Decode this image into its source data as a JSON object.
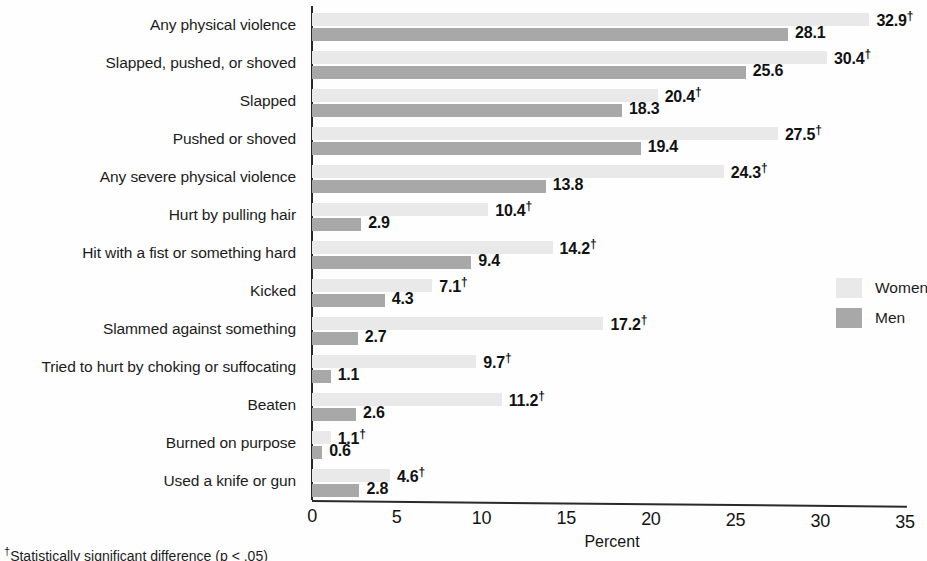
{
  "chart_data": {
    "type": "bar",
    "orientation": "horizontal",
    "title": "",
    "xlabel": "Percent",
    "ylabel": "",
    "xlim": [
      0,
      35
    ],
    "xticks": [
      0,
      5,
      10,
      15,
      20,
      25,
      30,
      35
    ],
    "grid": false,
    "legend_position": "right",
    "categories": [
      "Any physical violence",
      "Slapped, pushed, or shoved",
      "Slapped",
      "Pushed or shoved",
      "Any severe physical violence",
      "Hurt by pulling hair",
      "Hit with a fist or something hard",
      "Kicked",
      "Slammed against something",
      "Tried to hurt by choking or suffocating",
      "Beaten",
      "Burned on purpose",
      "Used a knife or gun"
    ],
    "series": [
      {
        "name": "Women",
        "color": "#e9e9e9",
        "values": [
          32.9,
          30.4,
          20.4,
          27.5,
          24.3,
          10.4,
          14.2,
          7.1,
          17.2,
          9.7,
          11.2,
          1.1,
          4.6
        ],
        "labels": [
          "32.9",
          "30.4",
          "20.4",
          "27.5",
          "24.3",
          "10.4",
          "14.2",
          "7.1",
          "17.2",
          "9.7",
          "11.2",
          "1.1",
          "4.6"
        ],
        "significant": [
          true,
          true,
          true,
          true,
          true,
          true,
          true,
          true,
          true,
          true,
          true,
          true,
          true
        ]
      },
      {
        "name": "Men",
        "color": "#a8a8a8",
        "values": [
          28.1,
          25.6,
          18.3,
          19.4,
          13.8,
          2.9,
          9.4,
          4.3,
          2.7,
          1.1,
          2.6,
          0.6,
          2.8
        ],
        "labels": [
          "28.1",
          "25.6",
          "18.3",
          "19.4",
          "13.8",
          "2.9",
          "9.4",
          "4.3",
          "2.7",
          "1.1",
          "2.6",
          "0.6",
          "2.8"
        ],
        "significant": [
          false,
          false,
          false,
          false,
          false,
          false,
          false,
          false,
          false,
          false,
          false,
          false,
          false
        ]
      }
    ],
    "significance_marker": "†",
    "footnote": "†Statistically significant difference (p < .05)"
  },
  "legend": {
    "items": [
      {
        "label": "Women",
        "color": "#e9e9e9"
      },
      {
        "label": "Men",
        "color": "#a8a8a8"
      }
    ]
  }
}
